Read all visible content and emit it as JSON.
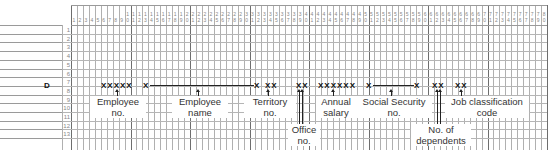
{
  "chart": {
    "record_code": "D",
    "record_row": 6,
    "row_numbers": [
      "1",
      "2",
      "3",
      "4",
      "5",
      "6",
      "7",
      "8",
      "9",
      "10",
      "11",
      "12",
      "13"
    ],
    "column_count": 80,
    "fields": [
      {
        "id": "employee-no",
        "pattern": "XXXXX",
        "label_line1": "Employee",
        "label_line2": "no."
      },
      {
        "id": "employee-name",
        "pattern": "X——X",
        "label_line1": "Employee",
        "label_line2": "name"
      },
      {
        "id": "territory-no",
        "pattern": "XX",
        "label_line1": "Territory",
        "label_line2": "no."
      },
      {
        "id": "office-no",
        "pattern": "XX",
        "label_line1": "Office",
        "label_line2": "no."
      },
      {
        "id": "annual-salary",
        "pattern": "XXXXXX",
        "label_line1": "Annual",
        "label_line2": "salary"
      },
      {
        "id": "social-security-no",
        "pattern": "X——X",
        "label_line1": "Social Security",
        "label_line2": "no."
      },
      {
        "id": "no-of-dependents",
        "pattern": "XX",
        "label_line1": "No. of",
        "label_line2": "dependents"
      },
      {
        "id": "job-classification-code",
        "pattern": "XX",
        "label_line1": "Job classification",
        "label_line2": "code"
      }
    ],
    "marks": {
      "d": "D",
      "emp_no": "XXXXX",
      "x": "X",
      "xx": "XX",
      "salary": "XXXXXX"
    }
  }
}
